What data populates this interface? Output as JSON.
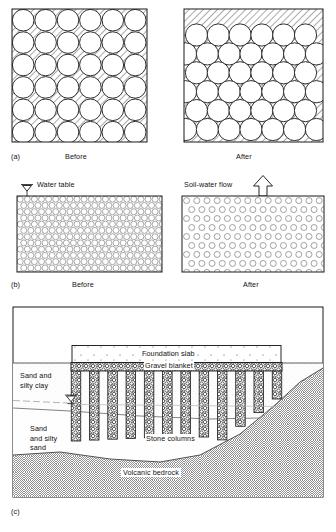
{
  "figure": {
    "domain": "scientific-diagram",
    "background_color": "#ffffff",
    "line_color": "#1a1a1a",
    "hatch_color": "#6f6f6f"
  },
  "panel_a": {
    "letter": "(a)",
    "left_caption": "Before",
    "right_caption": "After",
    "description": "Soil grain packing before and after densification",
    "before": {
      "packing": "square",
      "rows": 6,
      "cols": 6,
      "circle_radius_px": 10.4,
      "void_fill": "hatched"
    },
    "after": {
      "packing": "hexagonal-close",
      "rows": 6,
      "cols": 6,
      "circle_radius_px": 10.6,
      "void_fill": "hatched"
    }
  },
  "panel_b": {
    "letter": "(b)",
    "left_caption": "Before",
    "right_caption": "After",
    "water_table_label": "Water table",
    "soil_water_flow_label": "Soil-water flow",
    "description": "Pore water expelled as the soil densifies",
    "before": {
      "circle_spacing_px": 7.1,
      "circle_radius_px": 3.0,
      "density": "tight"
    },
    "after": {
      "circle_spacing_px": 10.2,
      "circle_radius_px": 3.0,
      "density": "loose"
    }
  },
  "panel_c": {
    "letter": "(c)",
    "description": "Cross-section of a foundation supported on stone columns",
    "labels": {
      "foundation_slab": "Foundation slab",
      "gravel_blanket": "Gravel blanket",
      "stone_columns": "Stone columns",
      "sand_and_silty_clay": "Sand and\nsilty clay",
      "sand_and_silty_sand": "Sand\nand silty\nsand",
      "volcanic_bedrock": "Volcanic bedrock"
    },
    "strata": [
      {
        "name": "Sand and silty clay",
        "order": 1
      },
      {
        "name": "Sand and silty sand",
        "order": 2
      },
      {
        "name": "Volcanic bedrock",
        "order": 3,
        "hatch": "basketweave"
      }
    ],
    "stone_column_count": 12,
    "water_table_symbol": true
  }
}
